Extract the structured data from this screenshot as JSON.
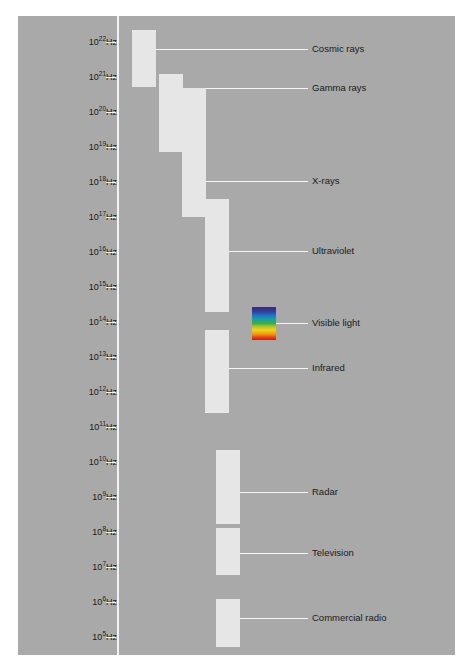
{
  "figure": {
    "background_color": "#a9a9a9",
    "bar_color": "#e6e6e6",
    "line_color": "#f7f7f7",
    "text_color": "#1a1a1a"
  },
  "axis": {
    "unit": "Hz",
    "orientation": "vertical",
    "direction": "high-to-low",
    "ticks": [
      {
        "mantissa": "10",
        "exponent": "22",
        "label": "10²²Hz",
        "y": 26
      },
      {
        "mantissa": "10",
        "exponent": "21",
        "label": "10²¹Hz",
        "y": 61
      },
      {
        "mantissa": "10",
        "exponent": "20",
        "label": "10²⁰Hz",
        "y": 96
      },
      {
        "mantissa": "10",
        "exponent": "19",
        "label": "10¹⁹Hz",
        "y": 131
      },
      {
        "mantissa": "10",
        "exponent": "18",
        "label": "10¹⁸Hz",
        "y": 166
      },
      {
        "mantissa": "10",
        "exponent": "17",
        "label": "10¹⁷Hz",
        "y": 201
      },
      {
        "mantissa": "10",
        "exponent": "16",
        "label": "10¹⁶Hz",
        "y": 236
      },
      {
        "mantissa": "10",
        "exponent": "15",
        "label": "10¹⁵Hz",
        "y": 271
      },
      {
        "mantissa": "10",
        "exponent": "14",
        "label": "10¹⁴Hz",
        "y": 306
      },
      {
        "mantissa": "10",
        "exponent": "13",
        "label": "10¹³Hz",
        "y": 341
      },
      {
        "mantissa": "10",
        "exponent": "12",
        "label": "10¹²Hz",
        "y": 376
      },
      {
        "mantissa": "10",
        "exponent": "11",
        "label": "10¹¹Hz",
        "y": 411
      },
      {
        "mantissa": "10",
        "exponent": "10",
        "label": "10¹⁰Hz",
        "y": 446
      },
      {
        "mantissa": "10",
        "exponent": "9",
        "label": "10⁹Hz",
        "y": 481
      },
      {
        "mantissa": "10",
        "exponent": "8",
        "label": "10⁸Hz",
        "y": 516
      },
      {
        "mantissa": "10",
        "exponent": "7",
        "label": "10⁷Hz",
        "y": 551
      },
      {
        "mantissa": "10",
        "exponent": "6",
        "label": "10⁶Hz",
        "y": 586
      },
      {
        "mantissa": "10",
        "exponent": "5",
        "label": "10⁵Hz",
        "y": 621
      }
    ]
  },
  "bands": [
    {
      "name": "cosmic-rays",
      "label": "Cosmic rays",
      "bar": {
        "x": 114,
        "y": 14,
        "width": 24,
        "height": 57
      },
      "leader": {
        "x": 138,
        "y": 33,
        "width": 152
      },
      "text": {
        "x": 294,
        "y": 28
      }
    },
    {
      "name": "gamma-rays",
      "label": "Gamma rays",
      "bar": {
        "x": 141,
        "y": 58,
        "width": 24,
        "height": 78
      },
      "leader": {
        "x": 165,
        "y": 72,
        "width": 125
      },
      "text": {
        "x": 294,
        "y": 67
      }
    },
    {
      "name": "x-rays",
      "label": "X-rays",
      "bar": {
        "x": 164,
        "y": 72,
        "width": 24,
        "height": 129
      },
      "leader": {
        "x": 188,
        "y": 165,
        "width": 102
      },
      "text": {
        "x": 294,
        "y": 160
      }
    },
    {
      "name": "ultraviolet",
      "label": "Ultraviolet",
      "bar": {
        "x": 187,
        "y": 183,
        "width": 24,
        "height": 113
      },
      "leader": {
        "x": 211,
        "y": 235,
        "width": 79
      },
      "text": {
        "x": 294,
        "y": 230
      }
    },
    {
      "name": "visible-light",
      "label": "Visible light",
      "bar": {
        "x": 234,
        "y": 291,
        "width": 24,
        "height": 33
      },
      "leader": {
        "x": 258,
        "y": 307,
        "width": 32
      },
      "text": {
        "x": 294,
        "y": 302
      },
      "gradient": [
        "#3b2a7a",
        "#2f3fa0",
        "#1f76c4",
        "#19a0a0",
        "#3fae3f",
        "#b9c42b",
        "#f2d21a",
        "#f29a10",
        "#e2421a",
        "#c21f12"
      ]
    },
    {
      "name": "infrared",
      "label": "Infrared",
      "bar": {
        "x": 187,
        "y": 314,
        "width": 24,
        "height": 83
      },
      "leader": {
        "x": 211,
        "y": 352,
        "width": 79
      },
      "text": {
        "x": 294,
        "y": 347
      }
    },
    {
      "name": "radar",
      "label": "Radar",
      "bar": {
        "x": 198,
        "y": 434,
        "width": 24,
        "height": 74
      },
      "leader": {
        "x": 222,
        "y": 476,
        "width": 68
      },
      "text": {
        "x": 294,
        "y": 471
      }
    },
    {
      "name": "television",
      "label": "Television",
      "bar": {
        "x": 198,
        "y": 512,
        "width": 24,
        "height": 47
      },
      "leader": {
        "x": 222,
        "y": 537,
        "width": 68
      },
      "text": {
        "x": 294,
        "y": 532
      }
    },
    {
      "name": "commercial-radio",
      "label": "Commercial radio",
      "bar": {
        "x": 198,
        "y": 583,
        "width": 24,
        "height": 48
      },
      "leader": {
        "x": 222,
        "y": 602,
        "width": 68
      },
      "text": {
        "x": 294,
        "y": 597
      }
    }
  ]
}
